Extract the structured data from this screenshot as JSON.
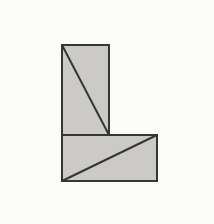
{
  "canvas": {
    "width": "214",
    "height": "224",
    "view_box": "0 0 214 224",
    "background": "#fcfcfb"
  },
  "figure": {
    "fill": "#cbcac6",
    "stroke": "#363636",
    "stroke_width": "2",
    "vertical_rect": {
      "x": "62",
      "y": "45",
      "width": "47",
      "height": "90"
    },
    "horizontal_rect": {
      "x": "62",
      "y": "135",
      "width": "95",
      "height": "46"
    },
    "diagonal_vertical_rect": {
      "d": "M 62 45 L 109 135"
    },
    "diagonal_horizontal_rect": {
      "d": "M 62 181 L 157 135"
    }
  }
}
